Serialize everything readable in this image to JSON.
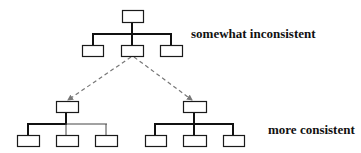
{
  "diagram": {
    "width": 361,
    "height": 153,
    "colors": {
      "background": "#ffffff",
      "box_stroke": "#1a1a1a",
      "thick_line": "#111111",
      "thin_line": "#444444",
      "dashed_arrow": "#777777",
      "label_text": "#111111"
    },
    "labels": {
      "top": "somewhat inconsistent",
      "bottom": "more consistent"
    },
    "trees": [
      {
        "id": "top-tree",
        "description": "somewhat inconsistent hierarchy",
        "root": {
          "x": 122,
          "y": 10,
          "w": 21,
          "h": 12
        },
        "bar_y": 34,
        "bar_x1": 93,
        "bar_x2": 171,
        "stem_x": 132,
        "children": [
          {
            "x": 82,
            "y": 45,
            "w": 21,
            "h": 11,
            "drop_x": 93,
            "weight": "thick"
          },
          {
            "x": 121,
            "y": 45,
            "w": 22,
            "h": 11,
            "drop_x": 132,
            "weight": "thick"
          },
          {
            "x": 160,
            "y": 45,
            "w": 22,
            "h": 11,
            "drop_x": 171,
            "weight": "thick"
          }
        ],
        "left_bar_weight": "thick",
        "right_bar_weight": "thick"
      },
      {
        "id": "bottom-left-tree",
        "description": "consistent variant A (heavy left branch)",
        "root": {
          "x": 56,
          "y": 101,
          "w": 22,
          "h": 11
        },
        "bar_y": 124,
        "bar_x1": 28,
        "bar_x2": 106,
        "stem_x": 66,
        "children": [
          {
            "x": 17,
            "y": 135,
            "w": 22,
            "h": 11,
            "drop_x": 28,
            "weight": "thick"
          },
          {
            "x": 56,
            "y": 135,
            "w": 22,
            "h": 11,
            "drop_x": 66,
            "weight": "thin"
          },
          {
            "x": 95,
            "y": 135,
            "w": 22,
            "h": 11,
            "drop_x": 106,
            "weight": "thin"
          }
        ],
        "left_bar_weight": "thick",
        "right_bar_weight": "thin"
      },
      {
        "id": "bottom-right-tree",
        "description": "consistent variant B (all heavy branches)",
        "root": {
          "x": 183,
          "y": 101,
          "w": 23,
          "h": 11
        },
        "bar_y": 124,
        "bar_x1": 155,
        "bar_x2": 233,
        "stem_x": 194,
        "children": [
          {
            "x": 145,
            "y": 135,
            "w": 21,
            "h": 11,
            "drop_x": 155,
            "weight": "thick"
          },
          {
            "x": 183,
            "y": 135,
            "w": 23,
            "h": 11,
            "drop_x": 194,
            "weight": "thick"
          },
          {
            "x": 223,
            "y": 135,
            "w": 21,
            "h": 11,
            "drop_x": 233,
            "weight": "thick"
          }
        ],
        "left_bar_weight": "thick",
        "right_bar_weight": "thick"
      }
    ],
    "arrows": [
      {
        "id": "arrow-to-bottom-left",
        "from": {
          "x": 131,
          "y": 57
        },
        "to": {
          "x": 68,
          "y": 100
        },
        "style": "dashed"
      },
      {
        "id": "arrow-to-bottom-right",
        "from": {
          "x": 134,
          "y": 57
        },
        "to": {
          "x": 192,
          "y": 100
        },
        "style": "dashed"
      }
    ],
    "label_positions": {
      "top": {
        "x": 191,
        "y": 27
      },
      "bottom": {
        "x": 268,
        "y": 123
      }
    }
  }
}
